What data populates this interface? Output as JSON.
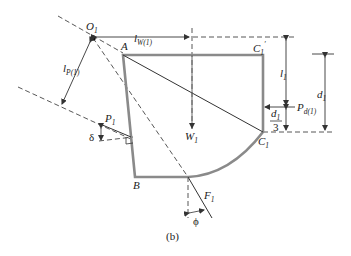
{
  "figure": {
    "caption": "(b)",
    "colors": {
      "outline": "#8a8a8a",
      "line": "#333333",
      "dashed": "#444444",
      "text": "#222222"
    }
  },
  "points": {
    "O1": {
      "main": "O",
      "sub": "1"
    },
    "A": {
      "main": "A"
    },
    "B": {
      "main": "B"
    },
    "C1_top": {
      "main": "C",
      "sub": "1",
      "prime": "′"
    },
    "C1": {
      "main": "C",
      "sub": "1"
    }
  },
  "forces": {
    "W1": {
      "main": "W",
      "sub": "1"
    },
    "P1": {
      "main": "P",
      "sub": "1"
    },
    "F1": {
      "main": "F",
      "sub": "1"
    },
    "Pd1": {
      "main": "P",
      "sub": "d(1)"
    }
  },
  "dimensions": {
    "lW1": {
      "main": "l",
      "sub": "W(1)"
    },
    "lP1": {
      "main": "l",
      "sub": "P(1)"
    },
    "l1": {
      "main": "l",
      "sub": "1"
    },
    "d1": {
      "main": "d",
      "sub": "1"
    },
    "d1_over_3": {
      "num_main": "d",
      "num_sub": "1",
      "den": "3"
    }
  },
  "angles": {
    "delta": "δ",
    "phi": "ϕ"
  }
}
